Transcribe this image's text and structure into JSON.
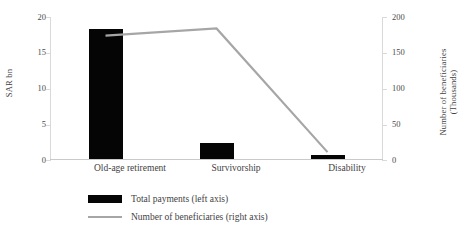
{
  "chart_data": {
    "type": "bar",
    "title": "",
    "subtitle": "",
    "categories": [
      "Old-age retirement",
      "Survivorship",
      "Disability"
    ],
    "series": [
      {
        "name": "Total payments (left axis)",
        "type": "bar",
        "axis": "left",
        "color": "#050505",
        "values": [
          18.2,
          2.3,
          0.55
        ]
      },
      {
        "name": "Number of beneficiaries (right axis)",
        "type": "line",
        "axis": "right",
        "color": "#a6a6a6",
        "values": [
          174,
          184,
          11
        ]
      }
    ],
    "xlabel": "",
    "ylabel": "SAR bn",
    "y2label": "Number of beneficiaries (Thousands)",
    "ylim": [
      0,
      20
    ],
    "y2lim": [
      0,
      200
    ],
    "yticks": [
      "0",
      "5",
      "10",
      "15",
      "20"
    ],
    "y2ticks": [
      "0",
      "50",
      "100",
      "150",
      "200"
    ],
    "grid": false,
    "legend_position": "bottom"
  },
  "axes": {
    "left_title": "SAR bn",
    "right_title_line1": "Number of beneficiaries",
    "right_title_line2": "(Thousands)",
    "left_ticks": [
      {
        "label": "20",
        "value": 20
      },
      {
        "label": "15",
        "value": 15
      },
      {
        "label": "10",
        "value": 10
      },
      {
        "label": "5",
        "value": 5
      },
      {
        "label": "0",
        "value": 0
      }
    ],
    "right_ticks": [
      {
        "label": "200",
        "value": 200
      },
      {
        "label": "150",
        "value": 150
      },
      {
        "label": "100",
        "value": 100
      },
      {
        "label": "50",
        "value": 50
      },
      {
        "label": "0",
        "value": 0
      }
    ]
  },
  "categories": [
    {
      "label": "Old-age retirement"
    },
    {
      "label": "Survivorship"
    },
    {
      "label": "Disability"
    }
  ],
  "legend": {
    "items": [
      {
        "label": "Total payments (left axis)",
        "marker": "bar-swatch",
        "color": "#050505"
      },
      {
        "label": "Number of beneficiaries (right axis)",
        "marker": "line-swatch",
        "color": "#a6a6a6"
      }
    ]
  }
}
